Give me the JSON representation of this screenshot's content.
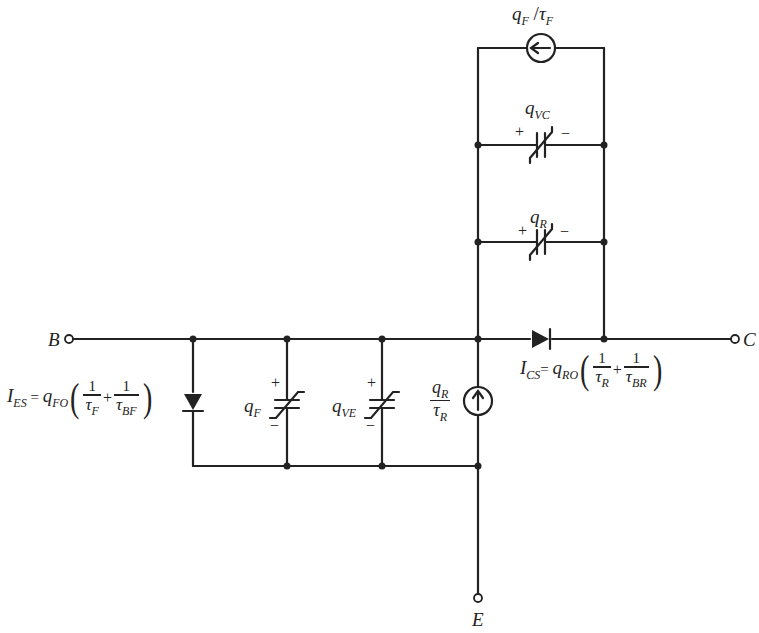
{
  "diagram": {
    "type": "circuit",
    "terminals": {
      "base": "B",
      "collector": "C",
      "emitter": "E"
    },
    "top_source": {
      "label_q": "q",
      "label_q_sub": "F",
      "label_slash": " /",
      "label_tau": "τ",
      "label_tau_sub": "F"
    },
    "cap_vc": {
      "label": "q",
      "label_sub": "VC",
      "plus": "+",
      "minus": "−"
    },
    "cap_r": {
      "label": "q",
      "label_sub": "R",
      "plus": "+",
      "minus": "−"
    },
    "cap_f": {
      "label": "q",
      "label_sub": "F",
      "plus": "+",
      "minus": "−"
    },
    "cap_ve": {
      "label": "q",
      "label_sub": "VE",
      "plus": "+",
      "minus": "−"
    },
    "reverse_source": {
      "num": "q",
      "num_sub": "R",
      "den": "τ",
      "den_sub": "R"
    },
    "emitter_diode_eq": {
      "lhs": "I",
      "lhs_sub": "ES",
      "eq": " = ",
      "coef": "q",
      "coef_sub": "FO",
      "open": "(",
      "f1_num": "1",
      "f1_den": "τ",
      "f1_den_sub": "F",
      "plus": "+",
      "f2_num": "1",
      "f2_den": "τ",
      "f2_den_sub": "BF",
      "close": ")"
    },
    "collector_diode_eq": {
      "lhs": "I",
      "lhs_sub": "CS",
      "eq": "= ",
      "coef": "q",
      "coef_sub": "RO",
      "open": "(",
      "f1_num": "1",
      "f1_den": "τ",
      "f1_den_sub": "R",
      "plus": "+",
      "f2_num": "1",
      "f2_den": "τ",
      "f2_den_sub": "BR",
      "close": ")"
    }
  }
}
